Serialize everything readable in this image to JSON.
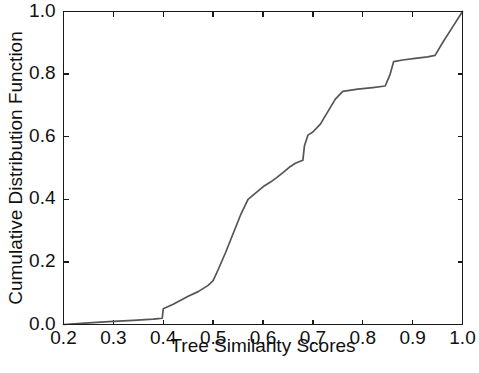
{
  "chart_data": {
    "type": "line",
    "title": "",
    "subtitle": "",
    "xlabel": "Tree Similarity Scores",
    "ylabel": "Cumulative Distribution Function",
    "xlim": [
      0.2,
      1.0
    ],
    "ylim": [
      0.0,
      1.0
    ],
    "xticks": [
      0.2,
      0.3,
      0.4,
      0.5,
      0.6,
      0.7,
      0.8,
      0.9,
      1.0
    ],
    "xtick_labels": [
      "0.2",
      "0.3",
      "0.4",
      "0.5",
      "0.6",
      "0.7",
      "0.8",
      "0.9",
      "1.0"
    ],
    "yticks": [
      0.0,
      0.2,
      0.4,
      0.6,
      0.8,
      1.0
    ],
    "ytick_labels": [
      "0.0",
      "0.2",
      "0.4",
      "0.6",
      "0.8",
      "1.0"
    ],
    "grid": false,
    "legend": false,
    "legend_position": "none",
    "annotations": [],
    "series": [
      {
        "name": "Tree similarity CDF",
        "color": "#555555",
        "line_width": 1.7,
        "x": [
          0.2,
          0.25,
          0.3,
          0.34,
          0.38,
          0.39,
          0.398,
          0.4,
          0.42,
          0.45,
          0.47,
          0.49,
          0.5,
          0.51,
          0.525,
          0.54,
          0.555,
          0.57,
          0.585,
          0.6,
          0.615,
          0.628,
          0.64,
          0.655,
          0.665,
          0.672,
          0.68,
          0.683,
          0.69,
          0.7,
          0.715,
          0.73,
          0.745,
          0.76,
          0.79,
          0.82,
          0.845,
          0.855,
          0.862,
          0.88,
          0.905,
          0.93,
          0.945,
          0.96,
          0.98,
          1.0
        ],
        "y": [
          0.0,
          0.005,
          0.01,
          0.013,
          0.017,
          0.019,
          0.02,
          0.05,
          0.065,
          0.09,
          0.105,
          0.125,
          0.14,
          0.175,
          0.23,
          0.29,
          0.35,
          0.4,
          0.42,
          0.44,
          0.455,
          0.47,
          0.485,
          0.505,
          0.515,
          0.52,
          0.525,
          0.57,
          0.605,
          0.615,
          0.64,
          0.68,
          0.72,
          0.745,
          0.752,
          0.757,
          0.762,
          0.8,
          0.84,
          0.845,
          0.85,
          0.855,
          0.86,
          0.9,
          0.95,
          1.0
        ]
      }
    ]
  },
  "figure": {
    "background_color": "#ffffff",
    "axis_color": "#1a1a1a",
    "text_color": "#101010"
  }
}
